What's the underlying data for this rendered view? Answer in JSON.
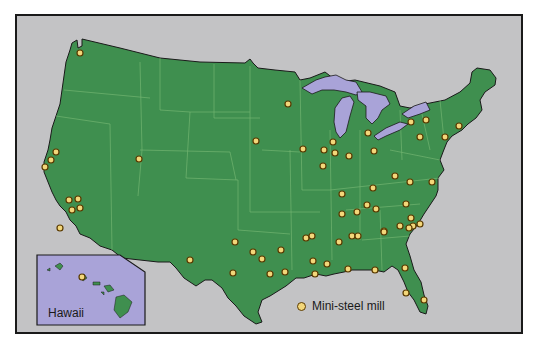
{
  "map": {
    "title": "Mini-steel mills in the United States",
    "colors": {
      "ocean": "#c3c3c5",
      "land": "#3f8f4f",
      "state_border": "#7fbf7a",
      "lakes": "#a9a3d8",
      "frame": "#1a1a1a",
      "mill_fill": "#f3d77a",
      "mill_stroke": "#5a3a00",
      "hawaii_bg": "#a9a3d8"
    },
    "legend": {
      "label": "Mini-steel mill",
      "icon": "circle-marker-icon"
    },
    "inset": {
      "label": "Hawaii",
      "mills": [
        [
          82,
          277
        ]
      ]
    },
    "mills": [
      [
        80,
        53
      ],
      [
        56,
        152
      ],
      [
        51,
        160
      ],
      [
        45,
        167
      ],
      [
        60,
        228
      ],
      [
        69,
        200
      ],
      [
        78,
        199
      ],
      [
        72,
        210
      ],
      [
        80,
        208
      ],
      [
        139,
        159
      ],
      [
        288,
        104
      ],
      [
        256,
        141
      ],
      [
        303,
        149
      ],
      [
        324,
        150
      ],
      [
        333,
        142
      ],
      [
        335,
        153
      ],
      [
        349,
        156
      ],
      [
        323,
        166
      ],
      [
        368,
        133
      ],
      [
        374,
        151
      ],
      [
        411,
        122
      ],
      [
        426,
        120
      ],
      [
        420,
        137
      ],
      [
        445,
        137
      ],
      [
        459,
        126
      ],
      [
        342,
        194
      ],
      [
        373,
        188
      ],
      [
        395,
        176
      ],
      [
        410,
        182
      ],
      [
        432,
        182
      ],
      [
        406,
        204
      ],
      [
        367,
        205
      ],
      [
        357,
        212
      ],
      [
        376,
        209
      ],
      [
        342,
        214
      ],
      [
        384,
        231
      ],
      [
        411,
        218
      ],
      [
        413,
        226
      ],
      [
        420,
        224
      ],
      [
        409,
        228
      ],
      [
        352,
        236
      ],
      [
        358,
        236
      ],
      [
        306,
        238
      ],
      [
        312,
        236
      ],
      [
        339,
        242
      ],
      [
        384,
        232
      ],
      [
        400,
        226
      ],
      [
        190,
        260
      ],
      [
        253,
        252
      ],
      [
        262,
        259
      ],
      [
        281,
        250
      ],
      [
        270,
        274
      ],
      [
        285,
        272
      ],
      [
        313,
        261
      ],
      [
        315,
        274
      ],
      [
        327,
        264
      ],
      [
        348,
        269
      ],
      [
        375,
        270
      ],
      [
        405,
        268
      ],
      [
        406,
        293
      ],
      [
        424,
        300
      ],
      [
        235,
        242
      ],
      [
        233,
        273
      ]
    ]
  }
}
